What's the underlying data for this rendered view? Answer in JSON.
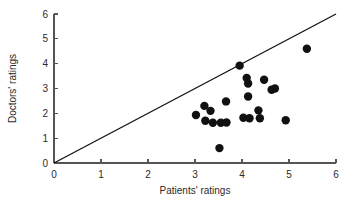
{
  "chart_data": {
    "type": "scatter",
    "title": "",
    "xlabel": "Patients' ratings",
    "ylabel": "Doctors' ratings",
    "xlim": [
      0,
      6
    ],
    "ylim": [
      0,
      6
    ],
    "xticks": [
      0,
      1,
      2,
      3,
      4,
      5,
      6
    ],
    "yticks": [
      0,
      1,
      2,
      3,
      4,
      5,
      6
    ],
    "xtick_labels": [
      "0",
      "1",
      "2",
      "3",
      "4",
      "5",
      "6"
    ],
    "ytick_labels": [
      "0",
      "1",
      "2",
      "3",
      "4",
      "5",
      "6"
    ],
    "grid": false,
    "legend": null,
    "marker": "filled-circle",
    "marker_color": "#111111",
    "marker_size": 4.2,
    "points": [
      {
        "x": 3.02,
        "y": 1.93
      },
      {
        "x": 3.2,
        "y": 2.3
      },
      {
        "x": 3.22,
        "y": 1.7
      },
      {
        "x": 3.33,
        "y": 2.1
      },
      {
        "x": 3.38,
        "y": 1.62
      },
      {
        "x": 3.52,
        "y": 0.6
      },
      {
        "x": 3.55,
        "y": 1.62
      },
      {
        "x": 3.66,
        "y": 2.48
      },
      {
        "x": 3.67,
        "y": 1.63
      },
      {
        "x": 3.95,
        "y": 3.92
      },
      {
        "x": 4.03,
        "y": 1.82
      },
      {
        "x": 4.1,
        "y": 3.42
      },
      {
        "x": 4.13,
        "y": 3.2
      },
      {
        "x": 4.13,
        "y": 2.68
      },
      {
        "x": 4.16,
        "y": 1.8
      },
      {
        "x": 4.35,
        "y": 2.12
      },
      {
        "x": 4.38,
        "y": 1.8
      },
      {
        "x": 4.47,
        "y": 3.35
      },
      {
        "x": 4.63,
        "y": 2.95
      },
      {
        "x": 4.7,
        "y": 3.0
      },
      {
        "x": 4.93,
        "y": 1.72
      },
      {
        "x": 5.38,
        "y": 4.6
      }
    ],
    "reference_line": {
      "name": "identity-line",
      "from": [
        0,
        0
      ],
      "to": [
        6,
        6
      ],
      "color": "#111111"
    }
  },
  "axes": {
    "x_title": "Patients' ratings",
    "y_title": "Doctors' ratings"
  }
}
